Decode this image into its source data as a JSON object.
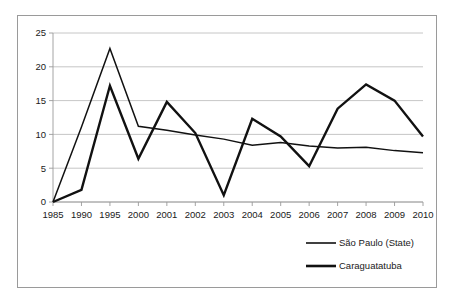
{
  "chart_data": {
    "type": "line",
    "title": "",
    "subtitle": "",
    "xlabel": "",
    "ylabel": "",
    "categories": [
      "1985",
      "1990",
      "1995",
      "2000",
      "2001",
      "2002",
      "2003",
      "2004",
      "2005",
      "2006",
      "2007",
      "2008",
      "2009",
      "2010"
    ],
    "ylim": [
      0,
      25
    ],
    "yticks": [
      0,
      5,
      10,
      15,
      20,
      25
    ],
    "ytick_labels": [
      "0",
      "5",
      "10",
      "15",
      "20",
      "25"
    ],
    "grid": "horizontal",
    "legend_position": "bottom-right",
    "series": [
      {
        "name": "São Paulo (State)",
        "line_style": "thin-solid",
        "color": "#111111",
        "values": [
          0,
          11.1,
          22.7,
          11.2,
          10.6,
          9.9,
          9.3,
          8.4,
          8.8,
          8.3,
          8.0,
          8.1,
          7.6,
          7.3
        ]
      },
      {
        "name": "Caraguatatuba",
        "line_style": "thick-solid",
        "color": "#111111",
        "values": [
          0,
          1.8,
          17.2,
          6.4,
          14.8,
          10.2,
          1.0,
          12.3,
          9.7,
          5.3,
          13.8,
          17.4,
          15.0,
          9.7
        ]
      }
    ]
  },
  "legend": {
    "items": [
      {
        "label": "São Paulo (State)"
      },
      {
        "label": "Caraguatatuba"
      }
    ]
  }
}
